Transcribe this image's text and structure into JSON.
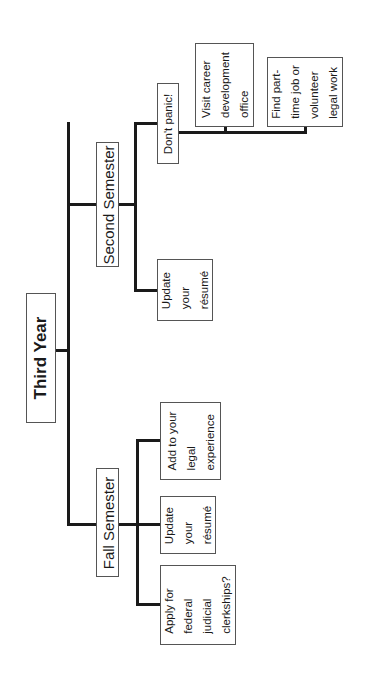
{
  "diagram": {
    "type": "tree",
    "orientation": "rotated-90-ccw",
    "root": {
      "label": "Third Year"
    },
    "branches": [
      {
        "label": "Second Semester",
        "children": [
          {
            "label": "Update your résumé",
            "lines": [
              "Update",
              "your",
              "résumé"
            ]
          },
          {
            "label": "Don't panic!",
            "lines": [
              "Don't panic!"
            ],
            "children": [
              {
                "label": "Visit career development office",
                "lines": [
                  "Visit career",
                  "development",
                  "office"
                ]
              },
              {
                "label": "Find part-time job or volunteer legal work",
                "lines": [
                  "Find part-",
                  "time job or",
                  "volunteer",
                  "legal work"
                ]
              }
            ]
          }
        ]
      },
      {
        "label": "Fall Semester",
        "children": [
          {
            "label": "Apply for federal judicial clerkships?",
            "lines": [
              "Apply for",
              "federal",
              "judicial",
              "clerkships?"
            ]
          },
          {
            "label": "Update your résumé",
            "lines": [
              "Update",
              "your",
              "résumé"
            ]
          },
          {
            "label": "Add to your legal experience",
            "lines": [
              "Add to your",
              "legal",
              "experience"
            ]
          }
        ]
      }
    ]
  }
}
